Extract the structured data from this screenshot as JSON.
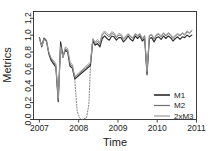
{
  "chart_data": {
    "type": "line",
    "title": "",
    "xlabel": "Time",
    "ylabel": "Metrics",
    "xlim": [
      2006.85,
      2011.0
    ],
    "ylim": [
      0.0,
      1.28
    ],
    "xticks": [
      2007,
      2008,
      2009,
      2010,
      2011
    ],
    "xticklabels": [
      "2007",
      "2008",
      "2009",
      "2010",
      "2011"
    ],
    "yticks": [
      0.0,
      0.2,
      0.4,
      0.6,
      0.8,
      1.0,
      1.2
    ],
    "yticklabels": [
      "0.0",
      "0.2",
      "0.4",
      "0.6",
      "0.8",
      "1.0",
      "1.2"
    ],
    "grid": false,
    "legend_position": "bottom-right",
    "legend": [
      "M1",
      "M2",
      "2xM3"
    ],
    "colors": [
      "#2b2b2b",
      "#6e6e6e",
      "#9a9a9a"
    ],
    "x": [
      2007.0,
      2007.06,
      2007.12,
      2007.18,
      2007.24,
      2007.3,
      2007.36,
      2007.42,
      2007.48,
      2007.54,
      2007.6,
      2007.66,
      2007.72,
      2007.78,
      2007.84,
      2007.9,
      2008.3,
      2008.36,
      2008.42,
      2008.48,
      2008.54,
      2008.6,
      2008.66,
      2008.72,
      2008.78,
      2008.84,
      2008.9,
      2008.96,
      2009.02,
      2009.08,
      2009.14,
      2009.2,
      2009.26,
      2009.32,
      2009.38,
      2009.44,
      2009.5,
      2009.56,
      2009.62,
      2009.68,
      2009.74,
      2009.8,
      2009.86,
      2009.92,
      2009.98,
      2010.04,
      2010.1,
      2010.16,
      2010.22,
      2010.28,
      2010.34,
      2010.4,
      2010.46,
      2010.52,
      2010.58,
      2010.64,
      2010.7,
      2010.76,
      2010.82,
      2010.88
    ],
    "series": [
      {
        "name": "M1",
        "values": [
          0.97,
          0.86,
          0.96,
          0.93,
          0.78,
          0.7,
          0.66,
          0.62,
          0.21,
          0.92,
          0.75,
          0.82,
          0.8,
          0.63,
          0.61,
          0.48,
          0.64,
          0.93,
          0.88,
          0.9,
          0.86,
          0.96,
          0.99,
          0.96,
          0.94,
          0.99,
          0.98,
          0.94,
          0.97,
          0.97,
          0.92,
          0.95,
          0.99,
          0.95,
          0.93,
          0.99,
          0.96,
          0.99,
          0.93,
          0.96,
          0.53,
          0.96,
          0.97,
          0.92,
          0.97,
          0.98,
          0.95,
          0.99,
          0.96,
          0.99,
          0.97,
          0.93,
          0.96,
          0.98,
          0.95,
          0.98,
          0.97,
          1.0,
          0.98,
          1.0
        ]
      },
      {
        "name": "M2",
        "values": [
          0.97,
          0.88,
          0.97,
          0.94,
          0.79,
          0.72,
          0.68,
          0.64,
          0.23,
          0.88,
          0.73,
          0.84,
          0.82,
          0.66,
          0.63,
          0.5,
          0.66,
          0.95,
          0.9,
          0.93,
          0.89,
          1.0,
          1.03,
          1.0,
          0.98,
          1.02,
          1.01,
          0.97,
          1.0,
          1.0,
          0.95,
          0.98,
          1.01,
          0.98,
          0.96,
          1.01,
          0.99,
          1.01,
          0.95,
          0.99,
          0.55,
          0.99,
          1.0,
          0.95,
          1.0,
          1.01,
          0.98,
          1.02,
          0.99,
          1.02,
          1.0,
          0.96,
          0.99,
          1.01,
          0.99,
          1.02,
          1.0,
          1.04,
          1.02,
          1.05
        ]
      },
      {
        "name": "2xM3",
        "values": [
          0.96,
          0.87,
          0.95,
          0.92,
          0.8,
          0.73,
          0.7,
          0.66,
          0.25,
          0.86,
          0.74,
          0.86,
          0.84,
          0.68,
          0.65,
          0.51,
          0.68,
          0.96,
          0.92,
          0.95,
          0.91,
          1.02,
          1.05,
          1.02,
          1.0,
          1.04,
          1.03,
          0.98,
          1.02,
          1.01,
          0.96,
          0.99,
          1.02,
          0.99,
          0.97,
          1.02,
          1.0,
          1.02,
          0.96,
          1.0,
          0.57,
          1.0,
          1.01,
          0.96,
          1.01,
          1.02,
          0.99,
          1.03,
          1.0,
          1.03,
          1.01,
          0.97,
          1.0,
          1.02,
          1.0,
          1.03,
          1.01,
          1.05,
          1.03,
          1.06
        ]
      }
    ],
    "dashed_gap": {
      "note": "dotted excursion to zero between 2007.90 and 2008.30",
      "x": [
        2007.9,
        2007.96,
        2008.02,
        2008.08,
        2008.14,
        2008.2,
        2008.26,
        2008.3
      ],
      "values": [
        0.48,
        0.1,
        0.02,
        0.0,
        0.01,
        0.02,
        0.18,
        0.64
      ]
    }
  }
}
